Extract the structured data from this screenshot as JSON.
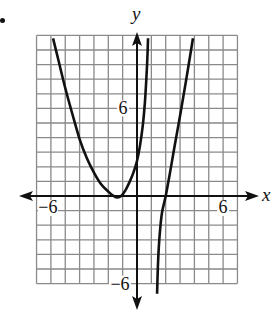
{
  "problem_marker": "•",
  "chart_data": {
    "type": "line",
    "title": "",
    "xlabel": "x",
    "ylabel": "y",
    "xlim": [
      -7,
      7
    ],
    "ylim": [
      -6,
      11
    ],
    "grid": true,
    "grid_step": 1,
    "x_tick_labels": [
      {
        "value": -6,
        "label": "−6"
      },
      {
        "value": 6,
        "label": "6"
      }
    ],
    "y_tick_labels": [
      {
        "value": 6,
        "label": "6"
      },
      {
        "value": -6,
        "label": "−6"
      }
    ],
    "series": [
      {
        "name": "left-branch",
        "points": [
          [
            -5.85,
            10.8
          ],
          [
            -5.5,
            9.4
          ],
          [
            -5,
            7.4
          ],
          [
            -4.5,
            5.6
          ],
          [
            -4,
            3.9
          ],
          [
            -3.5,
            2.6
          ],
          [
            -3,
            1.6
          ],
          [
            -2.5,
            0.8
          ],
          [
            -2,
            0.3
          ],
          [
            -1.7,
            0.05
          ],
          [
            -1.4,
            -0.1
          ],
          [
            -1.1,
            0.0
          ],
          [
            -0.8,
            0.4
          ],
          [
            -0.5,
            1.0
          ],
          [
            -0.25,
            1.6
          ],
          [
            0,
            2.4
          ],
          [
            0.2,
            3.4
          ],
          [
            0.4,
            4.8
          ],
          [
            0.55,
            6.4
          ],
          [
            0.65,
            8.0
          ],
          [
            0.72,
            9.4
          ],
          [
            0.77,
            10.8
          ]
        ]
      },
      {
        "name": "right-branch",
        "points": [
          [
            1.4,
            -6.7
          ],
          [
            1.45,
            -5.0
          ],
          [
            1.52,
            -3.5
          ],
          [
            1.62,
            -2.2
          ],
          [
            1.75,
            -1.1
          ],
          [
            2.0,
            0.0
          ],
          [
            2.3,
            1.6
          ],
          [
            2.6,
            3.3
          ],
          [
            3.0,
            5.5
          ],
          [
            3.4,
            7.8
          ],
          [
            3.9,
            10.8
          ]
        ]
      }
    ]
  }
}
